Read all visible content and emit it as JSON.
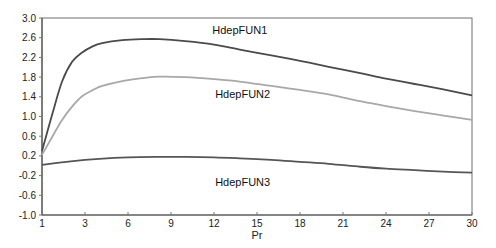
{
  "chart_data": {
    "type": "line",
    "title": "",
    "xlabel": "Pr",
    "ylabel": "",
    "xlim": [
      0,
      30
    ],
    "ylim": [
      -1.0,
      3.0
    ],
    "grid": false,
    "legend": "inline-labels",
    "x_ticks": [
      {
        "value": 0,
        "label": "1"
      },
      {
        "value": 3,
        "label": "3"
      },
      {
        "value": 6,
        "label": "6"
      },
      {
        "value": 9,
        "label": "9"
      },
      {
        "value": 12,
        "label": "12"
      },
      {
        "value": 15,
        "label": "15"
      },
      {
        "value": 18,
        "label": "18"
      },
      {
        "value": 21,
        "label": "21"
      },
      {
        "value": 24,
        "label": "24"
      },
      {
        "value": 27,
        "label": "27"
      },
      {
        "value": 30,
        "label": "30"
      }
    ],
    "y_ticks": [
      {
        "value": 3.0,
        "label": "3.0"
      },
      {
        "value": 2.6,
        "label": "2.6"
      },
      {
        "value": 2.2,
        "label": "2.2"
      },
      {
        "value": 1.8,
        "label": "1.8"
      },
      {
        "value": 1.4,
        "label": "1.4"
      },
      {
        "value": 1.0,
        "label": "1.0"
      },
      {
        "value": 0.6,
        "label": "0.6"
      },
      {
        "value": 0.2,
        "label": "0.2"
      },
      {
        "value": -0.2,
        "label": "-0.2"
      },
      {
        "value": -0.6,
        "label": "-0.6"
      },
      {
        "value": -1.0,
        "label": "-1.0"
      }
    ],
    "series": [
      {
        "name": "HdepFUN1",
        "color": "#4a4a4a",
        "label_pos": {
          "x": 13.8,
          "y": 2.68
        },
        "x": [
          0,
          0.7,
          1.4,
          2.1,
          2.8,
          3.5,
          4.2,
          5.6,
          7.0,
          8.2,
          10.0,
          12.0,
          13.8,
          16.0,
          18.0,
          20.0,
          22.2,
          24.0,
          26.0,
          28.0,
          30.0
        ],
        "y": [
          0.3,
          1.03,
          1.71,
          2.11,
          2.3,
          2.42,
          2.49,
          2.55,
          2.57,
          2.57,
          2.53,
          2.46,
          2.36,
          2.24,
          2.13,
          2.01,
          1.88,
          1.77,
          1.66,
          1.55,
          1.43
        ]
      },
      {
        "name": "HdepFUN2",
        "color": "#a8a8a8",
        "label_pos": {
          "x": 14.0,
          "y": 1.38
        },
        "x": [
          0,
          0.7,
          1.4,
          2.1,
          2.8,
          3.5,
          4.2,
          5.6,
          7.0,
          8.2,
          10.0,
          12.0,
          13.8,
          16.0,
          18.0,
          20.0,
          22.2,
          24.0,
          26.0,
          28.0,
          30.0
        ],
        "y": [
          0.22,
          0.58,
          0.93,
          1.2,
          1.41,
          1.53,
          1.62,
          1.72,
          1.78,
          1.81,
          1.8,
          1.76,
          1.71,
          1.62,
          1.54,
          1.45,
          1.31,
          1.21,
          1.11,
          1.02,
          0.93
        ]
      },
      {
        "name": "HdepFUN3",
        "color": "#555555",
        "label_pos": {
          "x": 14.0,
          "y": -0.42
        },
        "x": [
          0,
          2.0,
          4.0,
          6.0,
          8.2,
          10.0,
          12.0,
          13.8,
          16.0,
          18.0,
          20.0,
          22.2,
          24.0,
          26.0,
          28.0,
          30.0
        ],
        "y": [
          0.02,
          0.09,
          0.14,
          0.17,
          0.18,
          0.18,
          0.17,
          0.15,
          0.12,
          0.08,
          0.04,
          -0.02,
          -0.06,
          -0.09,
          -0.12,
          -0.14
        ]
      }
    ]
  }
}
